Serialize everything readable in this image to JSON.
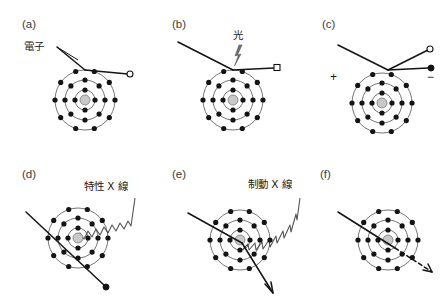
{
  "figure": {
    "title_visible": false,
    "background_color": "#ffffff",
    "ink_color": "#141414",
    "nucleus_color": "#c9c9c9",
    "shell_color": "#3a3a3a",
    "wave_color": "#555555",
    "panel_count": 6
  },
  "atom_model": {
    "shell_count": 3,
    "shell_radii": [
      10,
      20,
      30
    ],
    "electrons_per_shell": [
      4,
      8,
      10
    ],
    "nucleus_radius": 5,
    "electron_radius": 2.6
  },
  "panels": [
    {
      "id": "a",
      "label": "(a)",
      "caption": "電子",
      "caption_name": "electron-label",
      "interaction": "elastic-scattering",
      "endpoint_marker": "open-circle",
      "has_wave": false,
      "has_bolt": false
    },
    {
      "id": "b",
      "label": "(b)",
      "caption": "光",
      "caption_name": "light-label",
      "interaction": "photon-excitation",
      "endpoint_marker": "open-square",
      "has_wave": false,
      "has_bolt": true
    },
    {
      "id": "c",
      "label": "(c)",
      "caption": "",
      "caption_name": "ionization-signs",
      "interaction": "ionization",
      "sign_positive": "+",
      "sign_negative": "−",
      "endpoint_marker": "open-circle-and-dot",
      "has_wave": false,
      "has_bolt": false
    },
    {
      "id": "d",
      "label": "(d)",
      "caption": "特性 X 線",
      "caption_name": "characteristic-xray-label",
      "interaction": "characteristic-x-ray-emission",
      "endpoint_marker": "filled-dot",
      "has_wave": true,
      "has_bolt": false
    },
    {
      "id": "e",
      "label": "(e)",
      "caption": "制動 X 線",
      "caption_name": "bremsstrahlung-label",
      "interaction": "bremsstrahlung-emission",
      "endpoint_marker": "arrow",
      "has_wave": true,
      "has_bolt": false
    },
    {
      "id": "f",
      "label": "(f)",
      "caption": "",
      "caption_name": "no-interaction",
      "interaction": "pass-through",
      "endpoint_marker": "dashed-arrow",
      "has_wave": false,
      "has_bolt": false
    }
  ]
}
